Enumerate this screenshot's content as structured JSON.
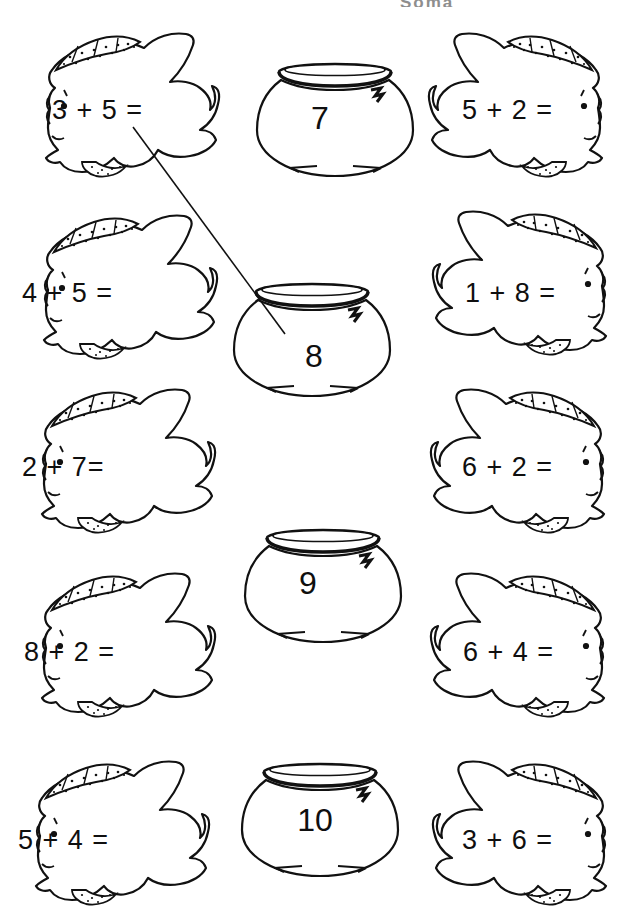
{
  "page": {
    "title_fragment": "Soma",
    "background": "#ffffff",
    "ink": "#111111",
    "width": 637,
    "height": 911
  },
  "worksheet": {
    "kind": "addition-matching-worksheet",
    "instruction_visible": false,
    "rows": [
      {
        "row": 1,
        "left_fish": {
          "equation": "3 + 5 =",
          "facing": "left",
          "x": 20,
          "y": 30,
          "w": 200,
          "h": 155,
          "text_x": 52,
          "text_y": 95
        },
        "bowl": {
          "number": "7",
          "x": 255,
          "y": 52,
          "w": 160,
          "h": 130,
          "num_x": 315,
          "num_y": 100
        },
        "right_fish": {
          "equation": "5 + 2 =",
          "facing": "right",
          "x": 428,
          "y": 30,
          "w": 200,
          "h": 155,
          "text_x": 462,
          "text_y": 95
        }
      },
      {
        "row": 2,
        "left_fish": {
          "equation": "4 + 5 =",
          "facing": "left",
          "x": 18,
          "y": 212,
          "w": 200,
          "h": 155,
          "text_x": 22,
          "text_y": 278
        },
        "bowl": {
          "number": "8",
          "x": 232,
          "y": 272,
          "w": 170,
          "h": 135,
          "num_x": 312,
          "num_y": 338
        },
        "right_fish": {
          "equation": "1 + 8 =",
          "facing": "right",
          "x": 432,
          "y": 208,
          "w": 200,
          "h": 155,
          "text_x": 465,
          "text_y": 278
        }
      },
      {
        "row": 3,
        "left_fish": {
          "equation": "2 + 7=",
          "facing": "left",
          "x": 16,
          "y": 386,
          "w": 200,
          "h": 155,
          "text_x": 22,
          "text_y": 452
        },
        "bowl": null,
        "right_fish": {
          "equation": "6 + 2 =",
          "facing": "right",
          "x": 430,
          "y": 386,
          "w": 200,
          "h": 155,
          "text_x": 462,
          "text_y": 452
        }
      },
      {
        "row": 4,
        "left_fish": {
          "equation": "8 + 2 =",
          "facing": "left",
          "x": 16,
          "y": 570,
          "w": 200,
          "h": 155,
          "text_x": 24,
          "text_y": 637
        },
        "bowl": {
          "number": "9",
          "x": 243,
          "y": 518,
          "w": 160,
          "h": 125,
          "num_x": 303,
          "num_y": 565
        },
        "right_fish": {
          "equation": "6 + 4 =",
          "facing": "right",
          "x": 430,
          "y": 570,
          "w": 200,
          "h": 155,
          "text_x": 463,
          "text_y": 637
        }
      },
      {
        "row": 5,
        "left_fish": {
          "equation": "5 + 4 =",
          "facing": "left",
          "x": 10,
          "y": 758,
          "w": 200,
          "h": 155,
          "text_x": 18,
          "text_y": 825
        },
        "bowl": {
          "number": "10",
          "x": 240,
          "y": 752,
          "w": 170,
          "h": 138,
          "num_x": 312,
          "num_y": 802
        },
        "right_fish": {
          "equation": "3 + 6 =",
          "facing": "right",
          "x": 432,
          "y": 758,
          "w": 200,
          "h": 155,
          "text_x": 462,
          "text_y": 825
        }
      }
    ],
    "drawn_answer_lines": [
      {
        "from_label": "3 + 5 =",
        "to_label": "8",
        "x1": 133,
        "y1": 127,
        "x2": 285,
        "y2": 334
      }
    ]
  }
}
